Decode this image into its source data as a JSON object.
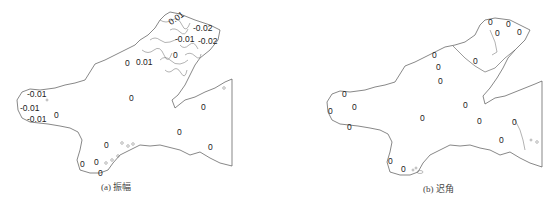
{
  "figure": {
    "panels": [
      {
        "id": "a",
        "caption": "(a) 振幅",
        "labels": [
          {
            "text": "-0.02",
            "x": 193,
            "y": 24
          },
          {
            "text": "-0.01",
            "x": 175,
            "y": 35
          },
          {
            "text": "-0.02",
            "x": 198,
            "y": 37
          },
          {
            "text": "0.01",
            "x": 168,
            "y": 14
          },
          {
            "text": "0",
            "x": 173,
            "y": 51
          },
          {
            "text": "0",
            "x": 125,
            "y": 59
          },
          {
            "text": "0.01",
            "x": 136,
            "y": 58
          },
          {
            "text": "-0.01",
            "x": 27,
            "y": 90
          },
          {
            "text": "-0.01",
            "x": 20,
            "y": 104
          },
          {
            "text": "-0.01",
            "x": 27,
            "y": 115
          },
          {
            "text": "0",
            "x": 54,
            "y": 111
          },
          {
            "text": "0",
            "x": 129,
            "y": 94
          },
          {
            "text": "0",
            "x": 201,
            "y": 103
          },
          {
            "text": "0",
            "x": 177,
            "y": 128
          },
          {
            "text": "0",
            "x": 208,
            "y": 143
          },
          {
            "text": "0",
            "x": 104,
            "y": 141
          },
          {
            "text": "0",
            "x": 80,
            "y": 160
          },
          {
            "text": "0",
            "x": 94,
            "y": 158
          },
          {
            "text": "0",
            "x": 98,
            "y": 169
          }
        ]
      },
      {
        "id": "b",
        "caption": "(b) 迟角",
        "labels": [
          {
            "text": "0",
            "x": 488,
            "y": 18
          },
          {
            "text": "0",
            "x": 506,
            "y": 20
          },
          {
            "text": "0",
            "x": 495,
            "y": 29
          },
          {
            "text": "0",
            "x": 517,
            "y": 28
          },
          {
            "text": "0",
            "x": 473,
            "y": 57
          },
          {
            "text": "0",
            "x": 432,
            "y": 51
          },
          {
            "text": "0",
            "x": 436,
            "y": 63
          },
          {
            "text": "0",
            "x": 438,
            "y": 77
          },
          {
            "text": "0",
            "x": 342,
            "y": 90
          },
          {
            "text": "0",
            "x": 328,
            "y": 107
          },
          {
            "text": "0",
            "x": 352,
            "y": 103
          },
          {
            "text": "0",
            "x": 347,
            "y": 123
          },
          {
            "text": "0",
            "x": 420,
            "y": 114
          },
          {
            "text": "0",
            "x": 463,
            "y": 101
          },
          {
            "text": "0",
            "x": 477,
            "y": 117
          },
          {
            "text": "0",
            "x": 512,
            "y": 118
          },
          {
            "text": "0",
            "x": 499,
            "y": 136
          },
          {
            "text": "0",
            "x": 388,
            "y": 157
          },
          {
            "text": "0",
            "x": 401,
            "y": 165
          }
        ]
      }
    ]
  }
}
